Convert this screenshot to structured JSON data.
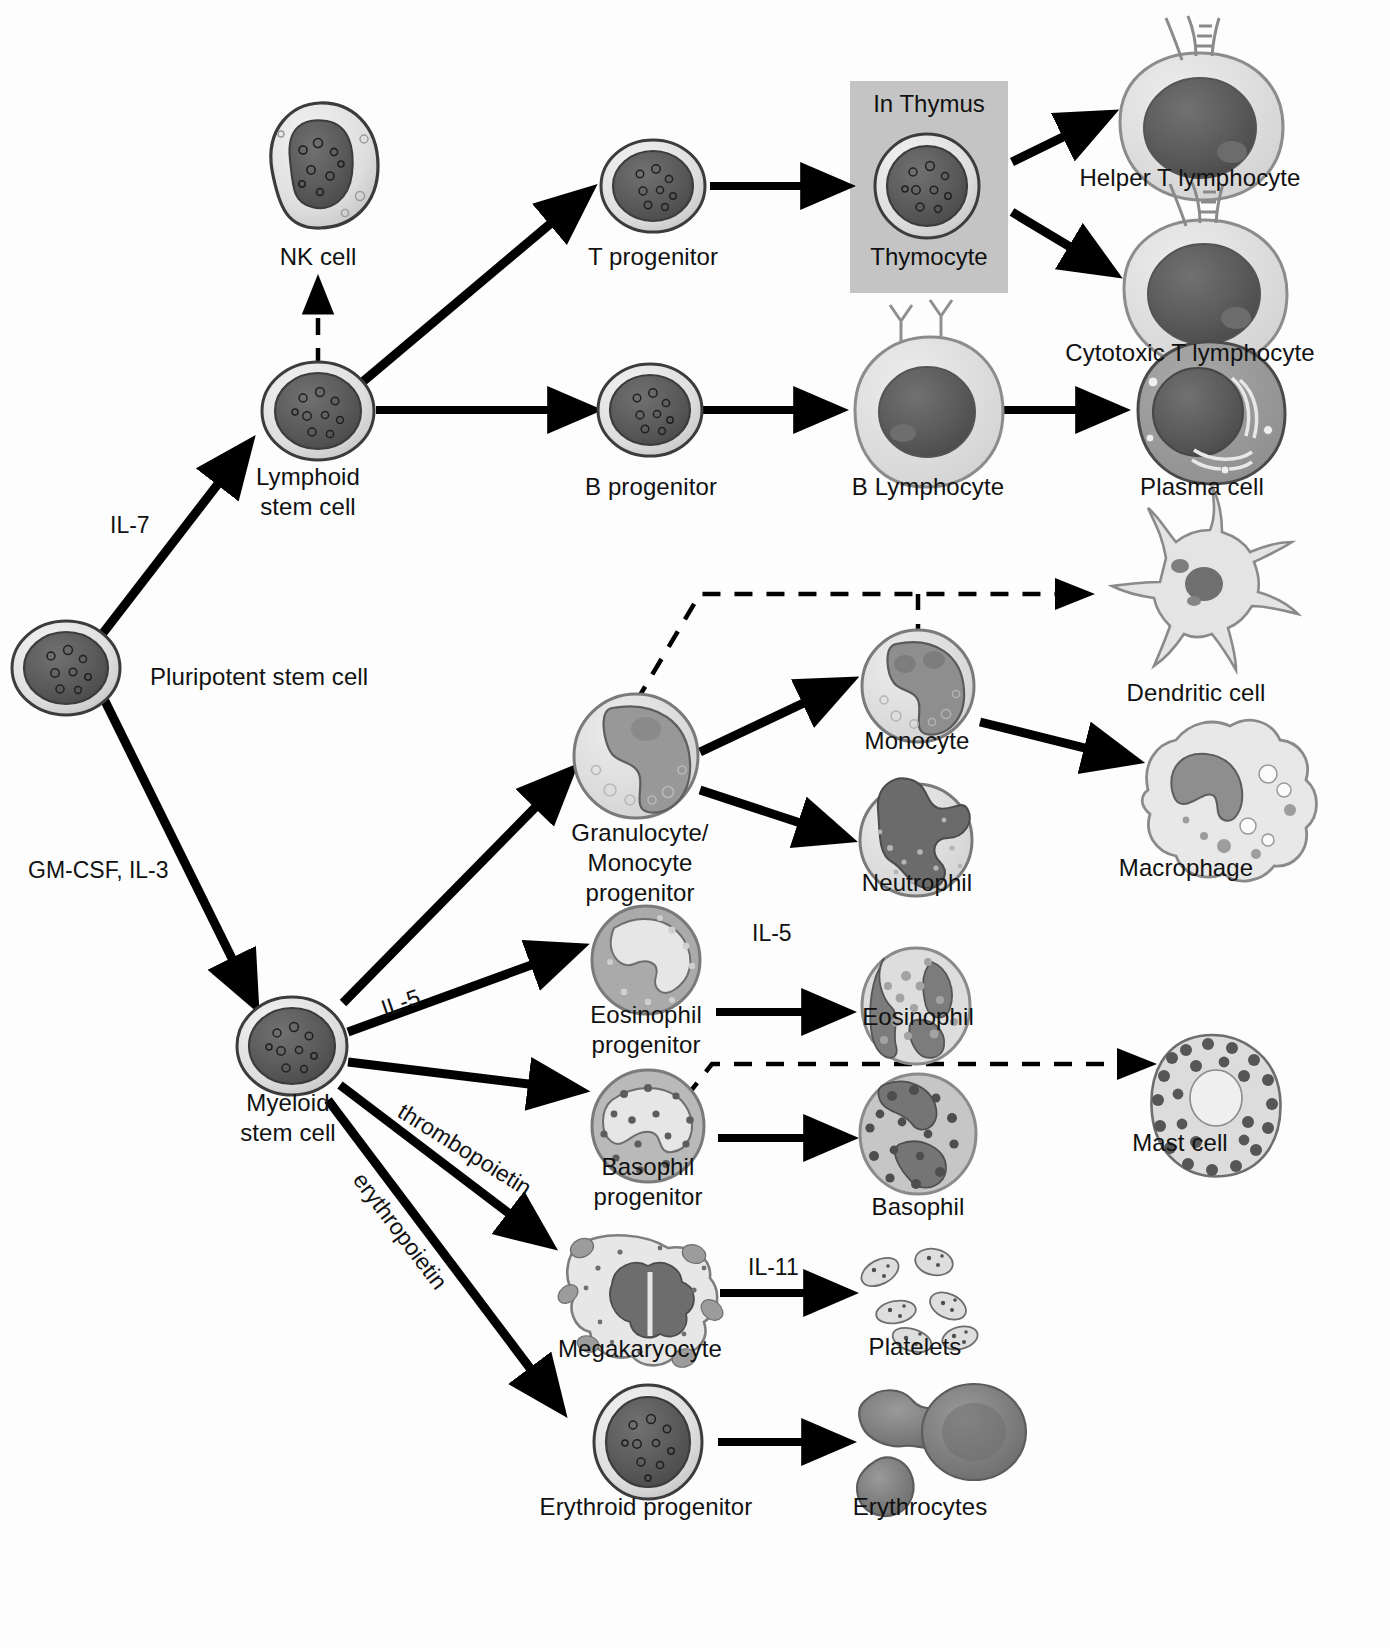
{
  "diagram": {
    "accent_color": "#000000",
    "thymus_box_color": "#c4c4c4",
    "nucleus_color": "#5a5a5a",
    "cytoplasm_color": "#d8d8d8"
  },
  "cells": [
    {
      "id": "nk",
      "label": "NK cell",
      "label_lines": [
        "NK cell"
      ]
    },
    {
      "id": "lymphoid",
      "label": "Lymphoid stem cell",
      "label_lines": [
        "Lymphoid",
        "stem cell"
      ]
    },
    {
      "id": "tprog",
      "label": "T progenitor",
      "label_lines": [
        "T progenitor"
      ]
    },
    {
      "id": "bprog",
      "label": "B progenitor",
      "label_lines": [
        "B progenitor"
      ]
    },
    {
      "id": "thymocyte",
      "label": "Thymocyte",
      "label_lines": [
        "Thymocyte"
      ]
    },
    {
      "id": "helperT",
      "label": "Helper T lymphocyte",
      "label_lines": [
        "Helper T lymphocyte"
      ]
    },
    {
      "id": "cytotoxicT",
      "label": "Cytotoxic T lymphocyte",
      "label_lines": [
        "Cytotoxic T lymphocyte"
      ]
    },
    {
      "id": "blymph",
      "label": "B Lymphocyte",
      "label_lines": [
        "B Lymphocyte"
      ]
    },
    {
      "id": "plasma",
      "label": "Plasma cell",
      "label_lines": [
        "Plasma cell"
      ]
    },
    {
      "id": "pluripotent",
      "label": "Pluripotent stem cell",
      "label_lines": [
        "Pluripotent stem cell"
      ]
    },
    {
      "id": "myeloid",
      "label": "Myeloid stem cell",
      "label_lines": [
        "Myeloid",
        "stem cell"
      ]
    },
    {
      "id": "gmprog",
      "label": "Granulocyte/Monocyte progenitor",
      "label_lines": [
        "Granulocyte/",
        "Monocyte",
        "progenitor"
      ]
    },
    {
      "id": "monocyte",
      "label": "Monocyte",
      "label_lines": [
        "Monocyte"
      ]
    },
    {
      "id": "neutrophil",
      "label": "Neutrophil",
      "label_lines": [
        "Neutrophil"
      ]
    },
    {
      "id": "dendritic",
      "label": "Dendritic cell",
      "label_lines": [
        "Dendritic cell"
      ]
    },
    {
      "id": "macrophage",
      "label": "Macrophage",
      "label_lines": [
        "Macrophage"
      ]
    },
    {
      "id": "eosprog",
      "label": "Eosinophil progenitor",
      "label_lines": [
        "Eosinophil",
        "progenitor"
      ]
    },
    {
      "id": "eosinophil",
      "label": "Eosinophil",
      "label_lines": [
        "Eosinophil"
      ]
    },
    {
      "id": "basoprog",
      "label": "Basophil progenitor",
      "label_lines": [
        "Basophil",
        "progenitor"
      ]
    },
    {
      "id": "basophil",
      "label": "Basophil",
      "label_lines": [
        "Basophil"
      ]
    },
    {
      "id": "mast",
      "label": "Mast cell",
      "label_lines": [
        "Mast cell"
      ]
    },
    {
      "id": "megakaryo",
      "label": "Megakaryocyte",
      "label_lines": [
        "Megakaryocyte"
      ]
    },
    {
      "id": "platelets",
      "label": "Platelets",
      "label_lines": [
        "Platelets"
      ]
    },
    {
      "id": "erythprog",
      "label": "Erythroid progenitor",
      "label_lines": [
        "Erythroid progenitor"
      ]
    },
    {
      "id": "erythrocytes",
      "label": "Erythrocytes",
      "label_lines": [
        "Erythrocytes"
      ]
    }
  ],
  "compartment": {
    "thymus_label": "In Thymus",
    "inner_cell_label": "Thymocyte"
  },
  "cytokines": [
    {
      "id": "il7",
      "label": "IL-7"
    },
    {
      "id": "gmcsf_il3",
      "label": "GM-CSF, IL-3"
    },
    {
      "id": "il5_myeloid",
      "label": "IL-5"
    },
    {
      "id": "il5_eos",
      "label": "IL-5"
    },
    {
      "id": "thrombopoietin",
      "label": "thrombopoietin"
    },
    {
      "id": "erythropoietin",
      "label": "erythropoietin"
    },
    {
      "id": "il11",
      "label": "IL-11"
    }
  ],
  "edges": [
    {
      "from": "pluripotent",
      "to": "lymphoid",
      "style": "solid",
      "label": "IL-7"
    },
    {
      "from": "pluripotent",
      "to": "myeloid",
      "style": "solid",
      "label": "GM-CSF, IL-3"
    },
    {
      "from": "lymphoid",
      "to": "nk",
      "style": "dashed",
      "label": ""
    },
    {
      "from": "lymphoid",
      "to": "tprog",
      "style": "solid",
      "label": ""
    },
    {
      "from": "lymphoid",
      "to": "bprog",
      "style": "solid",
      "label": ""
    },
    {
      "from": "tprog",
      "to": "thymocyte",
      "style": "solid",
      "label": ""
    },
    {
      "from": "thymocyte",
      "to": "helperT",
      "style": "solid",
      "label": ""
    },
    {
      "from": "thymocyte",
      "to": "cytotoxicT",
      "style": "solid",
      "label": ""
    },
    {
      "from": "bprog",
      "to": "blymph",
      "style": "solid",
      "label": ""
    },
    {
      "from": "blymph",
      "to": "plasma",
      "style": "solid",
      "label": ""
    },
    {
      "from": "myeloid",
      "to": "gmprog",
      "style": "solid",
      "label": ""
    },
    {
      "from": "myeloid",
      "to": "eosprog",
      "style": "solid",
      "label": "IL-5"
    },
    {
      "from": "myeloid",
      "to": "basoprog",
      "style": "solid",
      "label": ""
    },
    {
      "from": "myeloid",
      "to": "megakaryo",
      "style": "solid",
      "label": "thrombopoietin"
    },
    {
      "from": "myeloid",
      "to": "erythprog",
      "style": "solid",
      "label": "erythropoietin"
    },
    {
      "from": "gmprog",
      "to": "monocyte",
      "style": "solid",
      "label": ""
    },
    {
      "from": "gmprog",
      "to": "neutrophil",
      "style": "solid",
      "label": ""
    },
    {
      "from": "gmprog",
      "to": "dendritic",
      "style": "dashed",
      "label": ""
    },
    {
      "from": "monocyte",
      "to": "dendritic",
      "style": "dashed",
      "label": ""
    },
    {
      "from": "monocyte",
      "to": "macrophage",
      "style": "solid",
      "label": ""
    },
    {
      "from": "eosprog",
      "to": "eosinophil",
      "style": "solid",
      "label": "IL-5"
    },
    {
      "from": "basoprog",
      "to": "basophil",
      "style": "solid",
      "label": ""
    },
    {
      "from": "basoprog",
      "to": "mast",
      "style": "dashed",
      "label": ""
    },
    {
      "from": "megakaryo",
      "to": "platelets",
      "style": "solid",
      "label": "IL-11"
    },
    {
      "from": "erythprog",
      "to": "erythrocytes",
      "style": "solid",
      "label": ""
    }
  ]
}
